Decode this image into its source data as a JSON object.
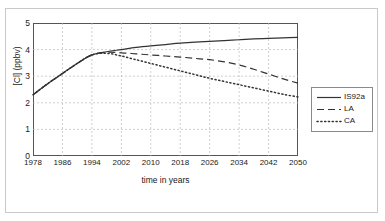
{
  "figure": {
    "border_color": "#c9c9c9",
    "background": "#ffffff"
  },
  "axes": {
    "frame_color": "#555555",
    "grid_color": "#bbbbbb"
  },
  "legend": {
    "position": "right-outside",
    "entries": [
      {
        "label": "IS92a",
        "style": "solid",
        "icon": "legend-line-solid-icon"
      },
      {
        "label": "LA",
        "style": "dashed",
        "icon": "legend-line-dashed-icon"
      },
      {
        "label": "CA",
        "style": "dotted",
        "icon": "legend-line-dotted-icon"
      }
    ]
  },
  "chart_data": {
    "type": "line",
    "title": "",
    "xlabel": "time in years",
    "ylabel": "[Cl] (ppbv)",
    "xlim": [
      1978,
      2050
    ],
    "ylim": [
      0,
      5
    ],
    "xticks": [
      1978,
      1986,
      1994,
      2002,
      2010,
      2018,
      2026,
      2034,
      2042,
      2050
    ],
    "yticks": [
      0,
      1,
      2,
      3,
      4,
      5
    ],
    "xtick_labels": [
      "1978",
      "1986",
      "1994",
      "2002",
      "2010",
      "2018",
      "2026",
      "2034",
      "2042",
      "2050"
    ],
    "ytick_labels": [
      "0",
      "1",
      "2",
      "3",
      "4",
      "5"
    ],
    "grid": true,
    "grid_style": "dashed",
    "legend_position": "right",
    "x": [
      1978,
      1982,
      1986,
      1990,
      1994,
      1998,
      2002,
      2006,
      2010,
      2014,
      2018,
      2022,
      2026,
      2030,
      2034,
      2038,
      2042,
      2046,
      2050
    ],
    "series": [
      {
        "name": "IS92a",
        "style": "solid",
        "color": "#333333",
        "values": [
          2.3,
          2.72,
          3.1,
          3.48,
          3.8,
          3.92,
          4.0,
          4.08,
          4.14,
          4.19,
          4.24,
          4.28,
          4.31,
          4.34,
          4.37,
          4.4,
          4.42,
          4.44,
          4.46
        ]
      },
      {
        "name": "LA",
        "style": "dashed",
        "color": "#333333",
        "values": [
          2.3,
          2.72,
          3.1,
          3.48,
          3.8,
          3.9,
          3.88,
          3.84,
          3.8,
          3.76,
          3.72,
          3.67,
          3.62,
          3.54,
          3.42,
          3.26,
          3.08,
          2.9,
          2.74
        ]
      },
      {
        "name": "CA",
        "style": "dotted",
        "color": "#333333",
        "values": [
          2.3,
          2.72,
          3.1,
          3.48,
          3.8,
          3.86,
          3.76,
          3.62,
          3.48,
          3.34,
          3.2,
          3.06,
          2.92,
          2.8,
          2.68,
          2.56,
          2.44,
          2.32,
          2.22
        ]
      }
    ]
  }
}
